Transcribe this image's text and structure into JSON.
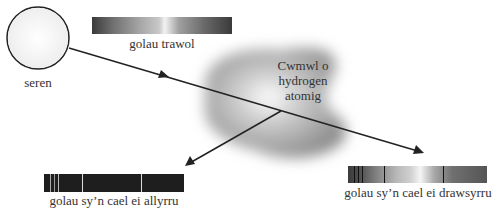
{
  "star": {
    "label": "seren"
  },
  "cloud": {
    "label_lines": [
      "Cwmwl o",
      "hydrogen",
      "atomig"
    ]
  },
  "spectra": {
    "continuous": {
      "label": "golau trawol"
    },
    "emission": {
      "label": "golau sy’n cael ei allyrru",
      "line_positions": [
        6,
        10,
        14,
        38,
        97
      ]
    },
    "absorption": {
      "label": "golau sy’n cael ei drawsyrru",
      "line_positions": [
        6,
        10,
        14,
        36,
        95
      ]
    }
  },
  "colors": {
    "stroke": "#222222",
    "cloud": "#9a9a9a",
    "emission_bg": "#1e1e1e"
  }
}
